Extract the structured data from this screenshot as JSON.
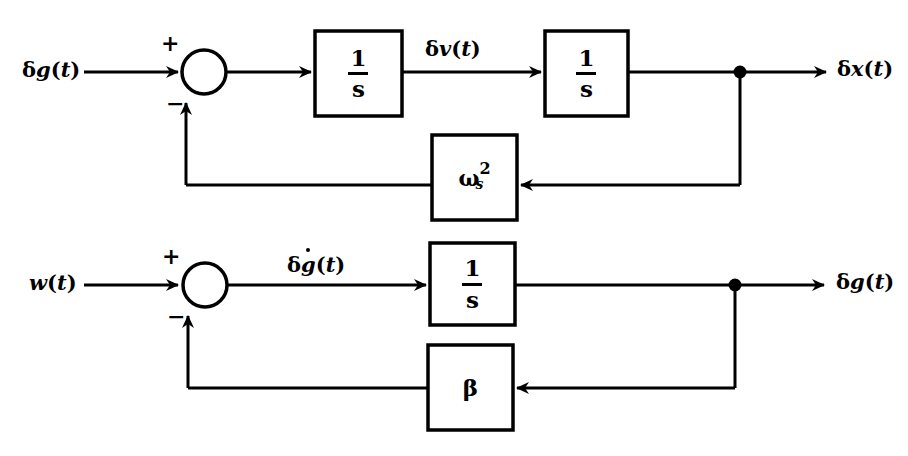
{
  "diagram": {
    "type": "control-block-diagram",
    "stroke_color": "#000000",
    "background_color": "#ffffff",
    "line_width": 3,
    "sections": [
      {
        "name": "upper-loop",
        "input_label": "δg(t)",
        "output_label": "δx(t)",
        "intermediate_label": "δv(t)",
        "forward_blocks": [
          "1/s",
          "1/s"
        ],
        "feedback_block": "ω²ₛ",
        "sum_signs": [
          "+",
          "−"
        ]
      },
      {
        "name": "lower-loop",
        "input_label": "w(t)",
        "output_label": "δg(t)",
        "intermediate_label": "δġ(t)",
        "forward_blocks": [
          "1/s"
        ],
        "feedback_block": "β",
        "sum_signs": [
          "+",
          "−"
        ]
      }
    ]
  },
  "upper": {
    "input": {
      "delta": "δ",
      "var": "g",
      "paren_open": "(",
      "t": "t",
      "paren_close": ")"
    },
    "sum_plus": "+",
    "sum_minus": "−",
    "block1": {
      "numerator": "1",
      "denominator": "s"
    },
    "mid_signal": {
      "delta": "δ",
      "var": "v",
      "paren_open": "(",
      "t": "t",
      "paren_close": ")"
    },
    "block2": {
      "numerator": "1",
      "denominator": "s"
    },
    "output": {
      "delta": "δ",
      "var": "x",
      "paren_open": "(",
      "t": "t",
      "paren_close": ")"
    },
    "feedback": {
      "base": "ω",
      "superscript": "2",
      "subscript": "s"
    }
  },
  "lower": {
    "input": {
      "var": "w",
      "paren_open": "(",
      "t": "t",
      "paren_close": ")"
    },
    "sum_plus": "+",
    "sum_minus": "−",
    "mid_signal": {
      "delta": "δ",
      "var": "g",
      "paren_open": "(",
      "t": "t",
      "paren_close": ")"
    },
    "block1": {
      "numerator": "1",
      "denominator": "s"
    },
    "output": {
      "delta": "δ",
      "var": "g",
      "paren_open": "(",
      "t": "t",
      "paren_close": ")"
    },
    "feedback": {
      "symbol": "β"
    }
  }
}
